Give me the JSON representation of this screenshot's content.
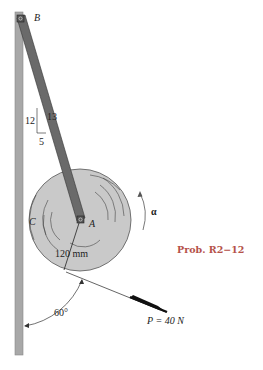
{
  "figure": {
    "problem_label": "Prob. R2−12",
    "points": {
      "B": "B",
      "A": "A",
      "C": "C"
    },
    "slope": {
      "rise": "12",
      "run": "5",
      "hyp": "13"
    },
    "radius_label": "120 mm",
    "angular_accel_label": "α",
    "angle_label": "60°",
    "force_label": "P = 40 N"
  },
  "colors": {
    "wall": "#a8a8a8",
    "rod": "#6a6a6a",
    "disk": "#c9c9c9",
    "problem_label": "#b5524a"
  }
}
